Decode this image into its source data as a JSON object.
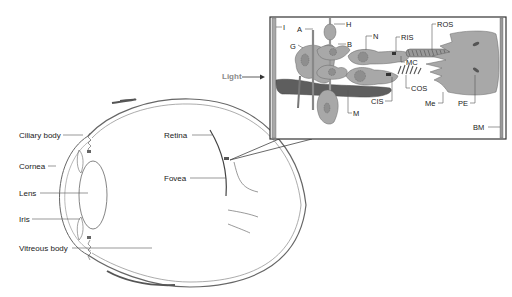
{
  "diagram": {
    "type": "anatomical-illustration",
    "eye_labels": {
      "ciliary_body": "Ciliary body",
      "cornea": "Cornea",
      "lens": "Lens",
      "iris": "Iris",
      "vitreous_body": "Vitreous body",
      "retina": "Retina",
      "fovea": "Fovea"
    },
    "light_label": "Light",
    "inset_labels": {
      "I": "I",
      "A": "A",
      "G": "G",
      "H": "H",
      "B": "B",
      "N": "N",
      "RIS": "RIS",
      "ROS": "ROS",
      "MC": "MC",
      "COS": "COS",
      "CIS": "CIS",
      "M": "M",
      "Me": "Me",
      "PE": "PE",
      "BM": "BM"
    },
    "colors": {
      "line": "#555555",
      "cell_fill": "#a8a8a8",
      "dark_fill": "#5e5e5e",
      "light_text": "#8a8a8a"
    }
  }
}
